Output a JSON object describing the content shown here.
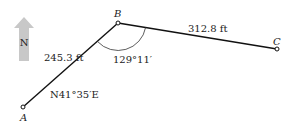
{
  "diagram": {
    "north_arrow": {
      "label": "N",
      "color": "#c8c8c8"
    },
    "points": {
      "A": {
        "label": "A"
      },
      "B": {
        "label": "B"
      },
      "C": {
        "label": "C"
      }
    },
    "segments": {
      "AB": {
        "length": "245.3 ft",
        "bearing": "N41°35′E"
      },
      "BC": {
        "length": "312.8 ft"
      }
    },
    "angle_B": "129°11′"
  }
}
